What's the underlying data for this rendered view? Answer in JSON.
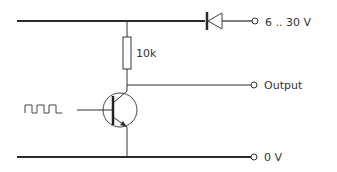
{
  "diagram": {
    "type": "transistor-switch-circuit",
    "labels": {
      "supply": "6 .. 30 V",
      "output": "Output",
      "ground": "0 V",
      "resistor": "10k"
    },
    "components": {
      "resistor": "10k pull-up resistor",
      "diode": "reverse-polarity protection diode",
      "transistor": "NPN transistor",
      "input_signal": "square-wave input"
    },
    "colors": {
      "line": "#2a2a2a",
      "text": "#333333"
    }
  }
}
